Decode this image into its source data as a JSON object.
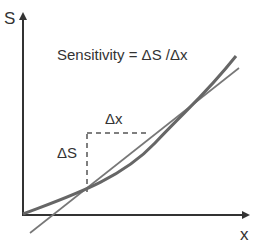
{
  "title": "Sensitivity = ΔS /Δx",
  "axes": {
    "y_label": "S",
    "x_label": "x"
  },
  "annotations": {
    "delta_x": "Δx",
    "delta_s": "ΔS"
  },
  "colors": {
    "axis": "#333333",
    "curve": "#666666",
    "tangent": "#777777",
    "dashed": "#555555",
    "text": "#333333"
  },
  "elements": {
    "curve": "sensitivity curve S(x), convex",
    "tangent": "tangent / secant line",
    "triangle": "dashed ΔS and Δx triangle"
  }
}
